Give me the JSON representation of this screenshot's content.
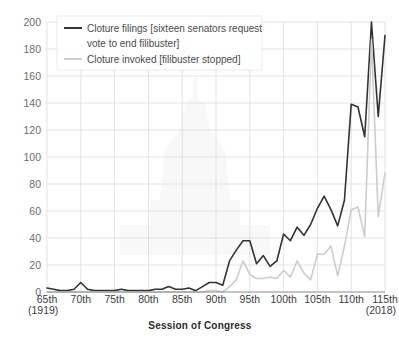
{
  "chart_data": {
    "type": "line",
    "title": "",
    "xlabel": "Session of Congress",
    "ylabel": "",
    "xlim": [
      65,
      115
    ],
    "ylim": [
      0,
      200
    ],
    "grid": true,
    "legend_position": "top-left",
    "x_tick_labels": [
      "65th",
      "70th",
      "75th",
      "80th",
      "85th",
      "90th",
      "95th",
      "100th",
      "105th",
      "110th",
      "115th"
    ],
    "x_tick_values": [
      65,
      70,
      75,
      80,
      85,
      90,
      95,
      100,
      105,
      110,
      115
    ],
    "y_tick_labels": [
      "0",
      "20",
      "40",
      "60",
      "80",
      "100",
      "120",
      "140",
      "160",
      "180",
      "200"
    ],
    "y_tick_values": [
      0,
      20,
      40,
      60,
      80,
      100,
      120,
      140,
      160,
      180,
      200
    ],
    "x_start_annotation": "(1919)",
    "x_end_annotation": "(2018)",
    "x": [
      65,
      66,
      67,
      68,
      69,
      70,
      71,
      72,
      73,
      74,
      75,
      76,
      77,
      78,
      79,
      80,
      81,
      82,
      83,
      84,
      85,
      86,
      87,
      88,
      89,
      90,
      91,
      92,
      93,
      94,
      95,
      96,
      97,
      98,
      99,
      100,
      101,
      102,
      103,
      104,
      105,
      106,
      107,
      108,
      109,
      110,
      111,
      112,
      113,
      114,
      115
    ],
    "series": [
      {
        "name": "Cloture filings [sixteen senators request vote to end filibuster]",
        "color": "#333333",
        "width": 1.6,
        "values": [
          3,
          2,
          1,
          1,
          2,
          7,
          2,
          1,
          1,
          1,
          1,
          2,
          1,
          1,
          1,
          1,
          2,
          2,
          4,
          2,
          2,
          3,
          1,
          4,
          7,
          7,
          5,
          23,
          31,
          38,
          38,
          21,
          27,
          19,
          23,
          43,
          38,
          48,
          42,
          50,
          62,
          71,
          61,
          49,
          68,
          139,
          137,
          115,
          253,
          130,
          190
        ]
      },
      {
        "name": "Cloture invoked [filibuster stopped]",
        "color": "#cdcdcd",
        "width": 1.6,
        "values": [
          0,
          0,
          0,
          0,
          0,
          0,
          0,
          0,
          0,
          0,
          0,
          0,
          0,
          0,
          0,
          0,
          0,
          0,
          0,
          0,
          0,
          0,
          0,
          0,
          1,
          1,
          0,
          4,
          9,
          23,
          13,
          10,
          10,
          11,
          10,
          16,
          11,
          23,
          14,
          9,
          28,
          28,
          34,
          12,
          34,
          61,
          63,
          41,
          187,
          56,
          88
        ]
      }
    ],
    "legend_entries": [
      {
        "label_line1": "Cloture filings [sixteen senators request",
        "label_line2": "vote to end filibuster]",
        "color": "#333333"
      },
      {
        "label_line1": "Cloture invoked [filibuster stopped]",
        "label_line2": "",
        "color": "#cdcdcd"
      }
    ],
    "colors": {
      "filings": "#333333",
      "invoked": "#cdcdcd",
      "grid": "#dcdcdc",
      "axis": "#8a8a8a",
      "tick_text": "#6d6d6d",
      "background": "#ffffff"
    }
  }
}
